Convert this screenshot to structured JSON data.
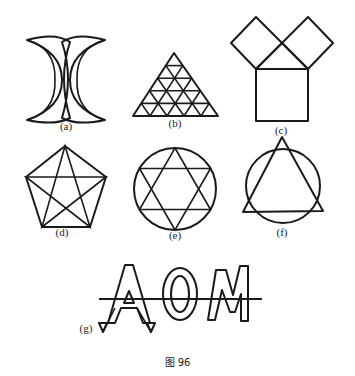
{
  "figure": {
    "caption": "图 96",
    "panels": [
      {
        "id": "a",
        "label": "(a)",
        "description": "Two crescents back-to-back, interlocking"
      },
      {
        "id": "b",
        "label": "(b)",
        "description": "Equilateral triangle subdivided into a 5-row triangular grid"
      },
      {
        "id": "c",
        "label": "(c)",
        "description": "Pythagorean figure: large square below a right isosceles triangle with two smaller squares on its legs"
      },
      {
        "id": "d",
        "label": "(d)",
        "description": "Regular pentagon with all diagonals forming a pentagram"
      },
      {
        "id": "e",
        "label": "(e)",
        "description": "Hexagram (six-pointed star) inscribed in a circle"
      },
      {
        "id": "f",
        "label": "(f)",
        "description": "Circle overlapping an equilateral triangle whose vertices extend beyond the circle"
      },
      {
        "id": "g",
        "label": "(g)",
        "description": "Outlined letters with a horizontal line through them",
        "letters": "AOM"
      }
    ]
  }
}
